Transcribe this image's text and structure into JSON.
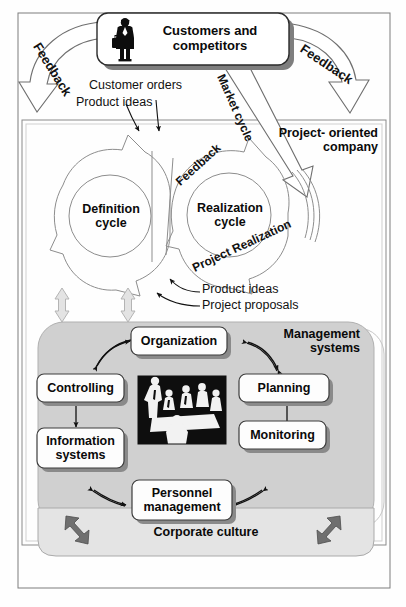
{
  "diagram": {
    "title_box": {
      "label": "Customers and\ncompetitors",
      "icon": "businessman-with-briefcase-icon"
    },
    "feedback_left": "Feedback",
    "feedback_right": "Feedback",
    "market_cycle": "Market cycle",
    "flows_top": [
      "Customer orders",
      "Product ideas"
    ],
    "company_label": "Project- oriented\ncompany",
    "cycles": {
      "definition": "Definition\ncycle",
      "realization": "Realization\ncycle",
      "feedback_inner": "Feedback",
      "project_realization": "Project Realization"
    },
    "flows_middle": [
      "Product ideas",
      "Project proposals"
    ],
    "management": {
      "title": "Management\nsystems",
      "center_image": "meeting-people-photo",
      "boxes": [
        {
          "id": "organization",
          "label": "Organization"
        },
        {
          "id": "controlling",
          "label": "Controlling"
        },
        {
          "id": "planning",
          "label": "Planning"
        },
        {
          "id": "information-systems",
          "label": "Information\nsystems"
        },
        {
          "id": "monitoring",
          "label": "Monitoring"
        },
        {
          "id": "personnel-management",
          "label": "Personnel\nmanagement"
        }
      ]
    },
    "corporate_culture": "Corporate culture",
    "colors": {
      "page_background": "#fefefe",
      "line": "#3a3a3a",
      "text": "#0a0a0a",
      "management_panel_fill": "#d0d0d0",
      "culture_band_fill": "#e2e2e2",
      "box_fill": "#fdfdfd",
      "box_shadow": "#8a8a8a",
      "arrow_light": "#d6d6d6",
      "arrow_dark": "#6f6f6f"
    }
  }
}
